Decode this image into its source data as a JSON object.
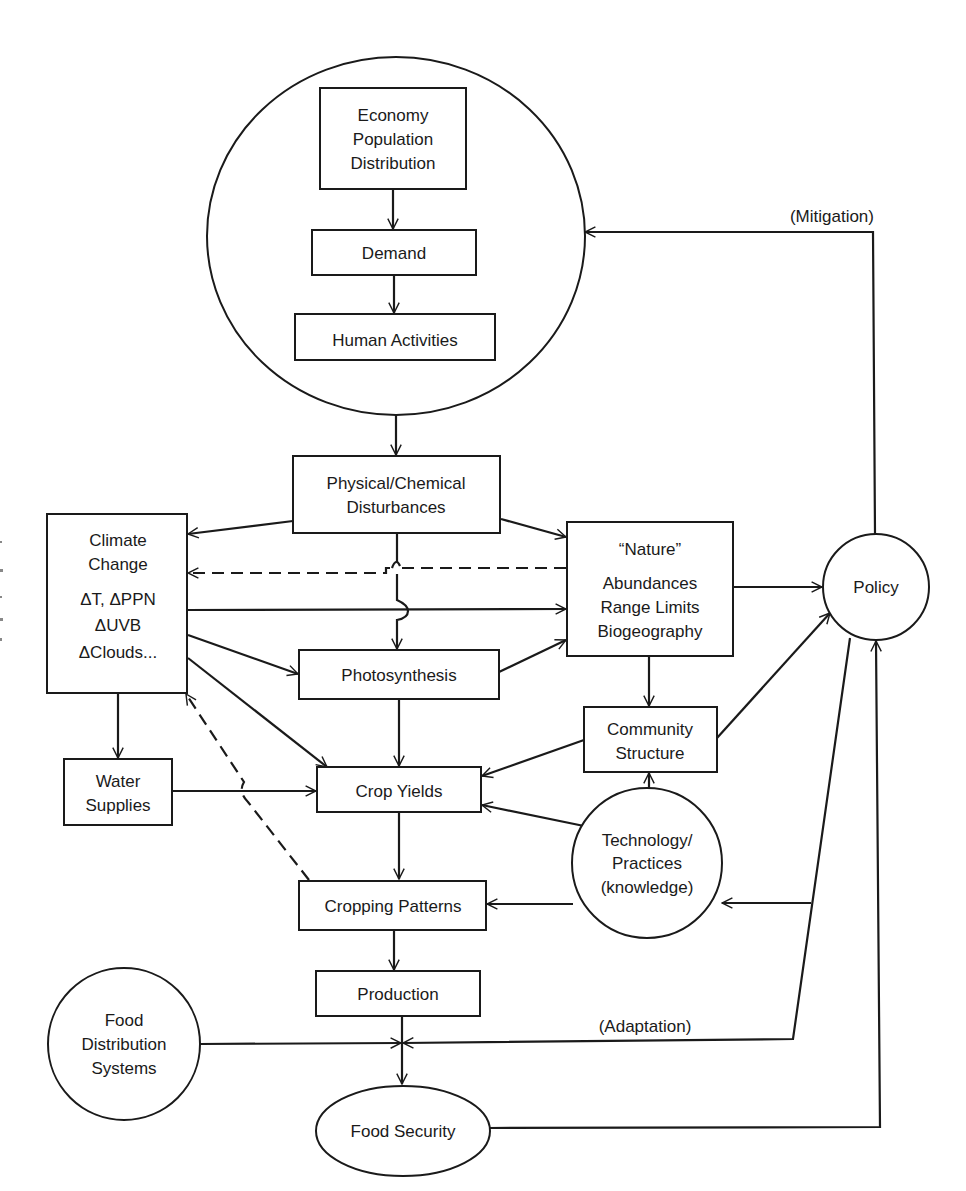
{
  "diagram": {
    "title": "",
    "colors": {
      "ink": "#1a1a1a",
      "background": "#ffffff"
    },
    "nodes": {
      "human_system": {
        "shape": "circle",
        "label": ""
      },
      "economy": {
        "shape": "box",
        "lines": [
          "Economy",
          "Population",
          "Distribution"
        ]
      },
      "demand": {
        "shape": "box",
        "lines": [
          "Demand"
        ]
      },
      "human_activities": {
        "shape": "box",
        "lines": [
          "Human Activities"
        ]
      },
      "disturbances": {
        "shape": "box",
        "lines": [
          "Physical/Chemical",
          "Disturbances"
        ]
      },
      "climate_change": {
        "shape": "box",
        "lines": [
          "Climate",
          "Change",
          "ΔT, ΔPPN",
          "ΔUVB",
          "ΔClouds..."
        ]
      },
      "nature": {
        "shape": "box",
        "lines": [
          "“Nature”",
          "Abundances",
          "Range Limits",
          "Biogeography"
        ]
      },
      "policy": {
        "shape": "circle",
        "lines": [
          "Policy"
        ]
      },
      "photosynthesis": {
        "shape": "box",
        "lines": [
          "Photosynthesis"
        ]
      },
      "community_structure": {
        "shape": "box",
        "lines": [
          "Community",
          "Structure"
        ]
      },
      "water_supplies": {
        "shape": "box",
        "lines": [
          "Water",
          "Supplies"
        ]
      },
      "crop_yields": {
        "shape": "box",
        "lines": [
          "Crop Yields"
        ]
      },
      "technology": {
        "shape": "circle",
        "lines": [
          "Technology/",
          "Practices",
          "(knowledge)"
        ]
      },
      "cropping_patterns": {
        "shape": "box",
        "lines": [
          "Cropping Patterns"
        ]
      },
      "production": {
        "shape": "box",
        "lines": [
          "Production"
        ]
      },
      "food_distribution": {
        "shape": "circle",
        "lines": [
          "Food",
          "Distribution",
          "Systems"
        ]
      },
      "food_security": {
        "shape": "ellipse",
        "lines": [
          "Food Security"
        ]
      }
    },
    "annotations": {
      "mitigation": "(Mitigation)",
      "adaptation": "(Adaptation)"
    },
    "edges": [
      {
        "from": "economy",
        "to": "demand",
        "style": "solid"
      },
      {
        "from": "demand",
        "to": "human_activities",
        "style": "solid"
      },
      {
        "from": "human_system",
        "to": "disturbances",
        "style": "solid"
      },
      {
        "from": "disturbances",
        "to": "climate_change",
        "style": "solid"
      },
      {
        "from": "disturbances",
        "to": "nature",
        "style": "solid"
      },
      {
        "from": "disturbances",
        "to": "photosynthesis",
        "style": "solid"
      },
      {
        "from": "nature",
        "to": "climate_change",
        "style": "dashed"
      },
      {
        "from": "climate_change",
        "to": "nature",
        "style": "solid"
      },
      {
        "from": "climate_change",
        "to": "photosynthesis",
        "style": "solid"
      },
      {
        "from": "climate_change",
        "to": "crop_yields",
        "style": "solid"
      },
      {
        "from": "climate_change",
        "to": "water_supplies",
        "style": "solid"
      },
      {
        "from": "photosynthesis",
        "to": "nature",
        "style": "solid"
      },
      {
        "from": "photosynthesis",
        "to": "crop_yields",
        "style": "solid"
      },
      {
        "from": "nature",
        "to": "policy",
        "style": "solid"
      },
      {
        "from": "nature",
        "to": "community_structure",
        "style": "solid"
      },
      {
        "from": "community_structure",
        "to": "crop_yields",
        "style": "solid"
      },
      {
        "from": "community_structure",
        "to": "policy",
        "style": "solid"
      },
      {
        "from": "water_supplies",
        "to": "crop_yields",
        "style": "solid"
      },
      {
        "from": "technology",
        "to": "community_structure",
        "style": "solid"
      },
      {
        "from": "technology",
        "to": "crop_yields",
        "style": "solid"
      },
      {
        "from": "technology",
        "to": "cropping_patterns",
        "style": "solid"
      },
      {
        "from": "crop_yields",
        "to": "cropping_patterns",
        "style": "solid"
      },
      {
        "from": "cropping_patterns",
        "to": "climate_change",
        "style": "dashed"
      },
      {
        "from": "cropping_patterns",
        "to": "production",
        "style": "solid"
      },
      {
        "from": "production",
        "to": "food_security",
        "style": "solid"
      },
      {
        "from": "food_distribution",
        "to": "food_security",
        "style": "solid"
      },
      {
        "from": "policy",
        "to": "human_system",
        "style": "solid",
        "label": "mitigation"
      },
      {
        "from": "policy",
        "to": "technology",
        "style": "solid"
      },
      {
        "from": "policy",
        "to": "food_security",
        "style": "solid",
        "label": "adaptation"
      },
      {
        "from": "food_security",
        "to": "policy",
        "style": "solid"
      }
    ]
  }
}
